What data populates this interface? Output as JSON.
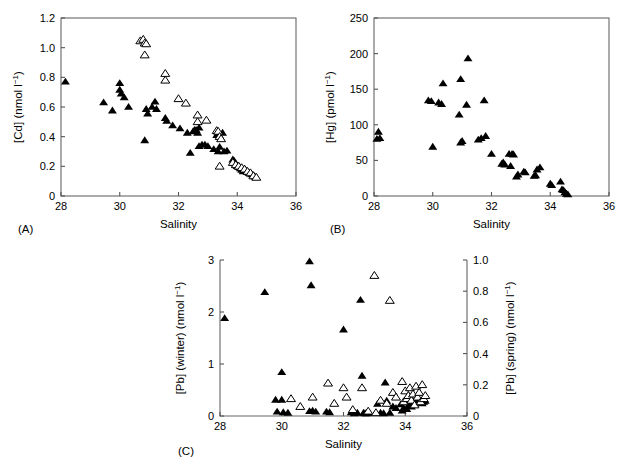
{
  "figure": {
    "caption_labels": [
      "(A)",
      "(B)",
      "(C)"
    ],
    "background_color": "#ffffff",
    "marker_colors": {
      "filled_triangle": "#000000",
      "open_triangle_stroke": "#000000",
      "open_triangle_fill": "#ffffff"
    },
    "axis_color": "#555555"
  },
  "chart_data": [
    {
      "id": "panel-a",
      "type": "scatter",
      "panel_label": "(A)",
      "title": "",
      "xlabel": "Salinity",
      "ylabel": "[Cd] (nmol l⁻¹)",
      "xlim": [
        28,
        36
      ],
      "ylim": [
        0,
        1.2
      ],
      "xticks": [
        28,
        30,
        32,
        34,
        36
      ],
      "xticklabels": [
        "28",
        "30",
        "32",
        "34",
        "36"
      ],
      "yticks": [
        0,
        0.2,
        0.4,
        0.6,
        0.8,
        1.0,
        1.2
      ],
      "yticklabels": [
        "0",
        "0.2",
        "0.4",
        "0.6",
        "0.8",
        "1.0",
        "1.2"
      ],
      "grid": false,
      "legend": "none",
      "series": [
        {
          "name": "winter (filled triangle)",
          "marker": "filled-triangle",
          "points": [
            [
              28.15,
              0.77
            ],
            [
              29.45,
              0.63
            ],
            [
              29.75,
              0.575
            ],
            [
              30.0,
              0.715
            ],
            [
              30.0,
              0.76
            ],
            [
              30.05,
              0.69
            ],
            [
              30.15,
              0.665
            ],
            [
              30.3,
              0.6
            ],
            [
              30.85,
              0.375
            ],
            [
              30.9,
              0.585
            ],
            [
              30.95,
              0.555
            ],
            [
              31.1,
              0.6
            ],
            [
              31.2,
              0.635
            ],
            [
              31.25,
              0.585
            ],
            [
              31.55,
              0.525
            ],
            [
              31.6,
              0.505
            ],
            [
              31.8,
              0.475
            ],
            [
              32.05,
              0.455
            ],
            [
              32.3,
              0.425
            ],
            [
              32.4,
              0.29
            ],
            [
              32.5,
              0.435
            ],
            [
              32.55,
              0.445
            ],
            [
              32.6,
              0.445
            ],
            [
              32.65,
              0.425
            ],
            [
              32.7,
              0.46
            ],
            [
              32.7,
              0.335
            ],
            [
              32.8,
              0.345
            ],
            [
              32.9,
              0.345
            ],
            [
              33.0,
              0.335
            ],
            [
              33.2,
              0.315
            ],
            [
              33.3,
              0.41
            ],
            [
              33.35,
              0.3
            ],
            [
              33.4,
              0.33
            ],
            [
              33.5,
              0.425
            ],
            [
              33.55,
              0.3
            ],
            [
              33.65,
              0.305
            ],
            [
              33.85,
              0.245
            ],
            [
              33.9,
              0.235
            ],
            [
              33.95,
              0.215
            ],
            [
              34.0,
              0.2
            ],
            [
              34.05,
              0.195
            ],
            [
              34.1,
              0.185
            ],
            [
              34.15,
              0.175
            ],
            [
              34.2,
              0.165
            ],
            [
              34.25,
              0.18
            ],
            [
              34.3,
              0.17
            ],
            [
              34.35,
              0.16
            ],
            [
              34.4,
              0.155
            ],
            [
              34.45,
              0.15
            ],
            [
              34.5,
              0.145
            ],
            [
              34.55,
              0.14
            ],
            [
              34.6,
              0.13
            ]
          ]
        },
        {
          "name": "spring (open triangle)",
          "marker": "open-triangle",
          "points": [
            [
              30.7,
              1.045
            ],
            [
              30.8,
              1.055
            ],
            [
              30.85,
              1.03
            ],
            [
              30.9,
              1.025
            ],
            [
              30.85,
              0.95
            ],
            [
              31.55,
              0.825
            ],
            [
              31.55,
              0.78
            ],
            [
              32.0,
              0.655
            ],
            [
              32.25,
              0.625
            ],
            [
              32.65,
              0.545
            ],
            [
              32.65,
              0.5
            ],
            [
              32.95,
              0.51
            ],
            [
              33.3,
              0.44
            ],
            [
              33.35,
              0.435
            ],
            [
              33.4,
              0.4
            ],
            [
              33.45,
              0.385
            ],
            [
              33.4,
              0.2
            ],
            [
              33.85,
              0.225
            ],
            [
              33.95,
              0.21
            ],
            [
              34.05,
              0.2
            ],
            [
              34.15,
              0.19
            ],
            [
              34.25,
              0.18
            ],
            [
              34.35,
              0.165
            ],
            [
              34.45,
              0.155
            ],
            [
              34.55,
              0.135
            ],
            [
              34.65,
              0.125
            ]
          ]
        }
      ]
    },
    {
      "id": "panel-b",
      "type": "scatter",
      "panel_label": "(B)",
      "title": "",
      "xlabel": "Salinity",
      "ylabel": "[Hg] (pmol l⁻¹)",
      "xlim": [
        28,
        36
      ],
      "ylim": [
        0,
        250
      ],
      "xticks": [
        28,
        30,
        32,
        34,
        36
      ],
      "xticklabels": [
        "28",
        "30",
        "32",
        "34",
        "36"
      ],
      "yticks": [
        0,
        50,
        100,
        150,
        200,
        250
      ],
      "yticklabels": [
        "0",
        "50",
        "100",
        "150",
        "200",
        "250"
      ],
      "grid": false,
      "legend": "none",
      "series": [
        {
          "name": "winter (filled triangle)",
          "marker": "filled-triangle",
          "points": [
            [
              28.1,
              80
            ],
            [
              28.15,
              90
            ],
            [
              28.2,
              81
            ],
            [
              29.85,
              134
            ],
            [
              29.95,
              133
            ],
            [
              30.0,
              69
            ],
            [
              30.2,
              131
            ],
            [
              30.3,
              129
            ],
            [
              30.35,
              158
            ],
            [
              30.9,
              114
            ],
            [
              30.95,
              164
            ],
            [
              30.95,
              75
            ],
            [
              31.0,
              77
            ],
            [
              31.15,
              128
            ],
            [
              31.2,
              193
            ],
            [
              31.55,
              79
            ],
            [
              31.65,
              81
            ],
            [
              31.75,
              134
            ],
            [
              31.8,
              84
            ],
            [
              32.0,
              59
            ],
            [
              32.35,
              45
            ],
            [
              32.4,
              47
            ],
            [
              32.45,
              44
            ],
            [
              32.6,
              59
            ],
            [
              32.65,
              42
            ],
            [
              32.7,
              59
            ],
            [
              32.75,
              58
            ],
            [
              32.85,
              27
            ],
            [
              32.9,
              30
            ],
            [
              33.1,
              34
            ],
            [
              33.15,
              33
            ],
            [
              33.45,
              28
            ],
            [
              33.5,
              29
            ],
            [
              33.55,
              37
            ],
            [
              33.65,
              40
            ],
            [
              34.0,
              17
            ],
            [
              34.05,
              15
            ],
            [
              34.35,
              20
            ],
            [
              34.4,
              9
            ],
            [
              34.45,
              8
            ],
            [
              34.5,
              5
            ],
            [
              34.55,
              3
            ],
            [
              34.6,
              2
            ]
          ]
        }
      ]
    },
    {
      "id": "panel-c",
      "type": "scatter",
      "panel_label": "(C)",
      "title": "",
      "xlabel": "Salinity",
      "ylabel": "[Pb] (winter) (nmol l⁻¹)",
      "ylabel_right": "[Pb] (spring) (nmol l⁻¹)",
      "xlim": [
        28,
        36
      ],
      "ylim": [
        0,
        3
      ],
      "ylim_right": [
        0,
        1.0
      ],
      "xticks": [
        28,
        30,
        32,
        34,
        36
      ],
      "xticklabels": [
        "28",
        "30",
        "32",
        "34",
        "36"
      ],
      "yticks": [
        0,
        1,
        2,
        3
      ],
      "yticklabels": [
        "0",
        "1",
        "2",
        "3"
      ],
      "yticks_right": [
        0,
        0.2,
        0.4,
        0.6,
        0.8,
        1.0
      ],
      "yticklabels_right": [
        "0",
        "0.2",
        "0.4",
        "0.6",
        "0.8",
        "1.0"
      ],
      "grid": false,
      "legend": "none",
      "series": [
        {
          "name": "winter (filled triangle, left axis)",
          "marker": "filled-triangle",
          "axis": "left",
          "points": [
            [
              28.15,
              1.88
            ],
            [
              29.45,
              2.38
            ],
            [
              29.8,
              0.31
            ],
            [
              29.85,
              0.08
            ],
            [
              30.0,
              0.84
            ],
            [
              30.0,
              0.31
            ],
            [
              30.05,
              0.07
            ],
            [
              30.2,
              0.06
            ],
            [
              30.9,
              2.97
            ],
            [
              30.95,
              2.51
            ],
            [
              30.9,
              0.09
            ],
            [
              31.0,
              0.1
            ],
            [
              31.1,
              0.08
            ],
            [
              31.45,
              0.08
            ],
            [
              31.55,
              0.07
            ],
            [
              32.0,
              1.66
            ],
            [
              32.25,
              0.07
            ],
            [
              32.35,
              0.05
            ],
            [
              32.45,
              0.06
            ],
            [
              32.55,
              2.23
            ],
            [
              32.6,
              0.77
            ],
            [
              32.65,
              0.06
            ],
            [
              32.7,
              0.05
            ],
            [
              32.75,
              0.05
            ],
            [
              32.8,
              0.06
            ],
            [
              33.1,
              0.23
            ],
            [
              33.2,
              0.06
            ],
            [
              33.3,
              0.05
            ],
            [
              33.35,
              0.64
            ],
            [
              33.4,
              0.29
            ],
            [
              33.5,
              0.06
            ],
            [
              33.6,
              0.18
            ],
            [
              33.7,
              0.15
            ],
            [
              33.85,
              0.22
            ],
            [
              33.9,
              0.1
            ],
            [
              33.95,
              0.15
            ],
            [
              34.0,
              0.3
            ],
            [
              34.05,
              0.13
            ],
            [
              34.1,
              0.2
            ],
            [
              34.15,
              0.25
            ],
            [
              34.2,
              0.18
            ],
            [
              34.25,
              0.29
            ],
            [
              34.3,
              0.22
            ],
            [
              34.35,
              0.25
            ],
            [
              34.4,
              0.3
            ],
            [
              34.45,
              0.26
            ],
            [
              34.5,
              0.28
            ],
            [
              34.55,
              0.24
            ],
            [
              34.6,
              0.27
            ],
            [
              34.65,
              0.29
            ]
          ]
        },
        {
          "name": "spring (open triangle, right axis)",
          "marker": "open-triangle",
          "axis": "right",
          "points": [
            [
              31.5,
              0.21
            ],
            [
              31.7,
              0.08
            ],
            [
              32.0,
              0.18
            ],
            [
              32.1,
              0.12
            ],
            [
              32.6,
              0.18
            ],
            [
              33.0,
              0.9
            ],
            [
              33.5,
              0.74
            ],
            [
              33.2,
              0.1
            ],
            [
              33.4,
              0.08
            ],
            [
              33.6,
              0.15
            ],
            [
              33.7,
              0.12
            ],
            [
              33.9,
              0.22
            ],
            [
              33.95,
              0.09
            ],
            [
              34.0,
              0.16
            ],
            [
              34.05,
              0.11
            ],
            [
              34.1,
              0.13
            ],
            [
              34.15,
              0.18
            ],
            [
              34.2,
              0.1
            ],
            [
              34.25,
              0.14
            ],
            [
              34.3,
              0.07
            ],
            [
              34.35,
              0.19
            ],
            [
              34.4,
              0.12
            ],
            [
              34.45,
              0.15
            ],
            [
              34.5,
              0.09
            ],
            [
              34.55,
              0.2
            ],
            [
              34.6,
              0.11
            ],
            [
              34.65,
              0.13
            ],
            [
              30.3,
              0.11
            ],
            [
              30.6,
              0.06
            ],
            [
              31.0,
              0.12
            ],
            [
              32.3,
              0.04
            ],
            [
              32.8,
              0.03
            ],
            [
              33.05,
              0.02
            ]
          ]
        }
      ]
    }
  ]
}
